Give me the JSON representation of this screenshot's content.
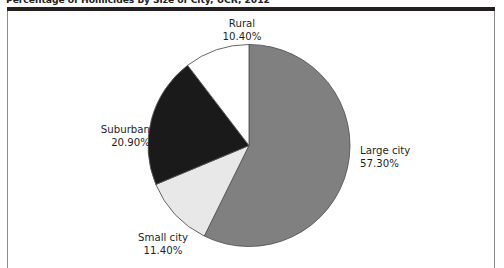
{
  "figure": {
    "title": "Percentage of Homicides by Size of City, UCR, 2012"
  },
  "colors": {
    "large_city": "#808080",
    "small_city": "#e8e8e8",
    "suburban": "#1a1a1a",
    "rural": "#ffffff",
    "slice_outline": "#555555",
    "rule": "#231f20",
    "frame": "#8b8b8b",
    "text": "#1f1f1f"
  },
  "labels": {
    "rural": {
      "name": "Rural",
      "value": "10.40%"
    },
    "suburban": {
      "name": "Suburban",
      "value": "20.90%"
    },
    "small_city": {
      "name": "Small city",
      "value": "11.40%"
    },
    "large_city": {
      "name": "Large city",
      "value": "57.30%"
    }
  },
  "chart_data": {
    "type": "pie",
    "title": "Percentage of Homicides by Size of City, UCR, 2012",
    "xlabel": "",
    "ylabel": "",
    "units": "percent",
    "start_angle_deg": 0,
    "direction": "clockwise",
    "legend": "none",
    "grid": false,
    "categories": [
      "Large city",
      "Small city",
      "Suburban",
      "Rural"
    ],
    "values": [
      57.3,
      11.4,
      20.9,
      10.4
    ],
    "total": 100.0,
    "slices": [
      {
        "label": "Large city",
        "value": 57.3,
        "display": "57.30%",
        "color": "#808080",
        "start_deg": 0.0,
        "end_deg": 206.28
      },
      {
        "label": "Small city",
        "value": 11.4,
        "display": "11.40%",
        "color": "#e8e8e8",
        "start_deg": 206.28,
        "end_deg": 247.32
      },
      {
        "label": "Suburban",
        "value": 20.9,
        "display": "20.90%",
        "color": "#1a1a1a",
        "start_deg": 247.32,
        "end_deg": 322.56
      },
      {
        "label": "Rural",
        "value": 10.4,
        "display": "10.40%",
        "color": "#ffffff",
        "start_deg": 322.56,
        "end_deg": 360.0
      }
    ]
  }
}
